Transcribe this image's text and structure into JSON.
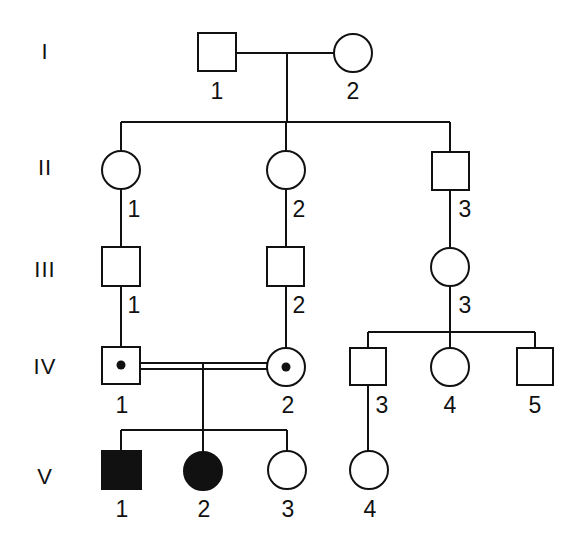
{
  "diagram": {
    "type": "pedigree",
    "generations": [
      {
        "label": "I",
        "y": 52
      },
      {
        "label": "II",
        "y": 168
      },
      {
        "label": "III",
        "y": 270
      },
      {
        "label": "IV",
        "y": 367
      },
      {
        "label": "V",
        "y": 477
      }
    ],
    "individuals": [
      {
        "id": "I-1",
        "label": "1",
        "sex": "male",
        "status": "unaffected",
        "x": 217,
        "y": 52,
        "label_x": 217,
        "label_y": 91
      },
      {
        "id": "I-2",
        "label": "2",
        "sex": "female",
        "status": "unaffected",
        "x": 353,
        "y": 53,
        "label_x": 353,
        "label_y": 91
      },
      {
        "id": "II-1",
        "label": "1",
        "sex": "female",
        "status": "unaffected",
        "x": 121,
        "y": 170,
        "label_x": 134,
        "label_y": 209
      },
      {
        "id": "II-2",
        "label": "2",
        "sex": "female",
        "status": "unaffected",
        "x": 286,
        "y": 170,
        "label_x": 299,
        "label_y": 209
      },
      {
        "id": "II-3",
        "label": "3",
        "sex": "male",
        "status": "unaffected",
        "x": 450,
        "y": 171,
        "label_x": 465,
        "label_y": 209
      },
      {
        "id": "III-1",
        "label": "1",
        "sex": "male",
        "status": "unaffected",
        "x": 121,
        "y": 266,
        "label_x": 134,
        "label_y": 305
      },
      {
        "id": "III-2",
        "label": "2",
        "sex": "male",
        "status": "unaffected",
        "x": 286,
        "y": 266,
        "label_x": 299,
        "label_y": 305
      },
      {
        "id": "III-3",
        "label": "3",
        "sex": "female",
        "status": "unaffected",
        "x": 450,
        "y": 267,
        "label_x": 465,
        "label_y": 305
      },
      {
        "id": "IV-1",
        "label": "1",
        "sex": "male",
        "status": "carrier",
        "x": 121,
        "y": 366,
        "label_x": 122,
        "label_y": 405
      },
      {
        "id": "IV-2",
        "label": "2",
        "sex": "female",
        "status": "carrier",
        "x": 286,
        "y": 367,
        "label_x": 288,
        "label_y": 405
      },
      {
        "id": "IV-3",
        "label": "3",
        "sex": "male",
        "status": "unaffected",
        "x": 368,
        "y": 367,
        "label_x": 382,
        "label_y": 405
      },
      {
        "id": "IV-4",
        "label": "4",
        "sex": "female",
        "status": "unaffected",
        "x": 450,
        "y": 367,
        "label_x": 450,
        "label_y": 405
      },
      {
        "id": "IV-5",
        "label": "5",
        "sex": "male",
        "status": "unaffected",
        "x": 535,
        "y": 367,
        "label_x": 535,
        "label_y": 405
      },
      {
        "id": "V-1",
        "label": "1",
        "sex": "male",
        "status": "affected",
        "x": 121,
        "y": 470,
        "label_x": 122,
        "label_y": 509
      },
      {
        "id": "V-2",
        "label": "2",
        "sex": "female",
        "status": "affected",
        "x": 203,
        "y": 471,
        "label_x": 204,
        "label_y": 509
      },
      {
        "id": "V-3",
        "label": "3",
        "sex": "female",
        "status": "unaffected",
        "x": 287,
        "y": 470,
        "label_x": 288,
        "label_y": 509
      },
      {
        "id": "V-4",
        "label": "4",
        "sex": "female",
        "status": "unaffected",
        "x": 369,
        "y": 470,
        "label_x": 370,
        "label_y": 509
      }
    ],
    "unions": [
      {
        "partners": [
          "I-1",
          "I-2"
        ],
        "consanguineous": false
      },
      {
        "partners": [
          "IV-1",
          "IV-2"
        ],
        "consanguineous": true
      }
    ],
    "legend": {
      "filled": "affected",
      "dot": "carrier",
      "double_line": "consanguineous mating"
    }
  }
}
